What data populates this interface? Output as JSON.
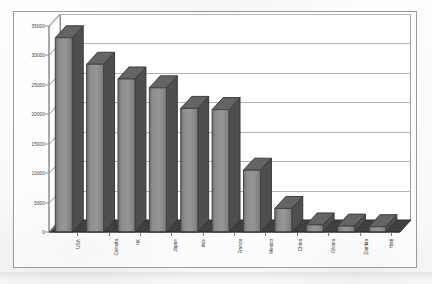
{
  "chart_data": {
    "type": "bar",
    "title": "",
    "subtitle": "",
    "xlabel": "",
    "ylabel": "",
    "categories": [
      "USA",
      "Canada",
      "HK",
      "Japan",
      "Italy",
      "France",
      "Mexico",
      "China",
      "Ghana",
      "Zambia",
      "Haiti"
    ],
    "values": [
      33000,
      28500,
      26000,
      24500,
      21000,
      20800,
      10500,
      4000,
      1200,
      1000,
      900
    ],
    "ylim": [
      0,
      35000
    ],
    "ytick_labels": [
      "35000",
      "30000",
      "25000",
      "20000",
      "15000",
      "10000",
      "5000",
      "0"
    ],
    "ytick_values": [
      35000,
      30000,
      25000,
      20000,
      15000,
      10000,
      5000,
      0
    ],
    "grid": true,
    "legend": false,
    "legend_position": "none",
    "style": "3d-column",
    "series": [
      {
        "name": "Series 1",
        "values": [
          33000,
          28500,
          26000,
          24500,
          21000,
          20800,
          10500,
          4000,
          1200,
          1000,
          900
        ]
      }
    ]
  },
  "colors": {
    "bar_front": "#8c8c8c",
    "bar_side": "#4e4e4e",
    "bar_top": "#646464",
    "gridline": "#b4b4b4",
    "axis": "#8a8a8a",
    "floor": "#3f3f3f",
    "frame": "#9a9a9a",
    "text": "#373737",
    "plot_background": "#ffffff"
  }
}
